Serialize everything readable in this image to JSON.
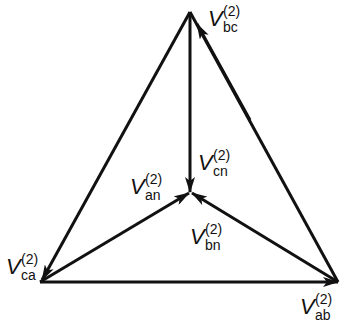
{
  "diagram": {
    "labels": {
      "bc": {
        "symbol": "V",
        "sup": "(2)",
        "sub": "bc"
      },
      "cn": {
        "symbol": "V",
        "sup": "(2)",
        "sub": "cn"
      },
      "an": {
        "symbol": "V",
        "sup": "(2)",
        "sub": "an"
      },
      "bn": {
        "symbol": "V",
        "sup": "(2)",
        "sub": "bn"
      },
      "ca": {
        "symbol": "V",
        "sup": "(2)",
        "sub": "ca"
      },
      "ab": {
        "symbol": "V",
        "sup": "(2)",
        "sub": "ab"
      }
    },
    "stroke_color": "#111111"
  }
}
